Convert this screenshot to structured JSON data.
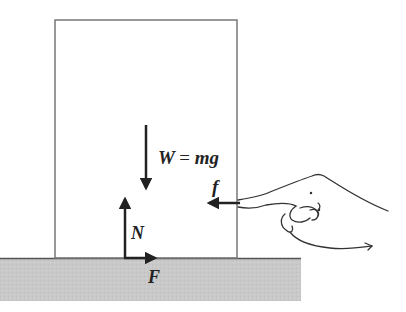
{
  "diagram": {
    "colors": {
      "background": "#ffffff",
      "box_outline": "#777777",
      "ground_fill": "#c8c8c8",
      "ground_edge": "#555555",
      "arrow": "#222222",
      "hand_outline": "#333333"
    },
    "forces": {
      "weight": {
        "symbol": "W",
        "equals": "=",
        "m": "m",
        "g": "g",
        "direction": "down"
      },
      "friction_finger": {
        "symbol": "f",
        "direction": "left"
      },
      "normal": {
        "symbol": "N",
        "direction": "up"
      },
      "friction_ground": {
        "symbol": "F",
        "direction": "right"
      }
    }
  }
}
